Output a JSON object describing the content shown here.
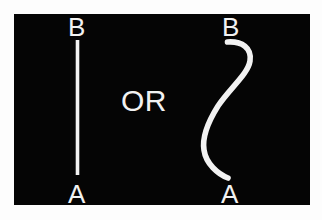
{
  "figure": {
    "background_color": "#050505",
    "page_color": "#fdfdfd",
    "stroke_color": "#f2f2f2"
  },
  "paths": [
    {
      "id": "straight-path",
      "name": "straight-line-path",
      "shape": "straight vertical line",
      "start_label": "A",
      "end_label": "B",
      "stroke_width": 4
    },
    {
      "id": "curved-path",
      "name": "curved-s-path",
      "shape": "S-shaped curve",
      "start_label": "A",
      "end_label": "B",
      "stroke_width": 6
    }
  ],
  "connector": {
    "label": "OR"
  },
  "labels": {
    "straight_top": "B",
    "straight_bottom": "A",
    "curved_top": "B",
    "curved_bottom": "A",
    "or": "OR"
  }
}
